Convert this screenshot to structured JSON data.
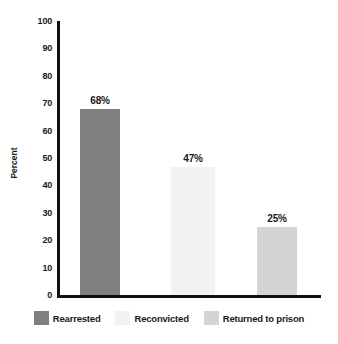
{
  "chart_data": {
    "type": "bar",
    "title": "",
    "xlabel": "",
    "ylabel": "Percent",
    "ylim": [
      0,
      100
    ],
    "grid": false,
    "legend_position": "bottom",
    "categories": [
      "Rearrested",
      "Reconvicted",
      "Returned to prison"
    ],
    "values": [
      68,
      47,
      25
    ],
    "value_labels": [
      "68%",
      "47%",
      "25%"
    ],
    "bar_colors": [
      "#808080",
      "#f2f2f2",
      "#d4d4d4"
    ],
    "ytick_labels": [
      "100",
      "90",
      "80",
      "70",
      "60",
      "50",
      "40",
      "30",
      "20",
      "10",
      "0"
    ],
    "ytick_values": [
      100,
      90,
      80,
      70,
      60,
      50,
      40,
      30,
      20,
      10,
      0
    ],
    "axis_color": "#111111",
    "text_color": "#1a1a1a",
    "background_color": "#ffffff"
  },
  "legend": {
    "items": [
      {
        "label": "Rearrested",
        "color": "#808080"
      },
      {
        "label": "Reconvicted",
        "color": "#f2f2f2"
      },
      {
        "label": "Returned to prison",
        "color": "#d4d4d4"
      }
    ]
  }
}
